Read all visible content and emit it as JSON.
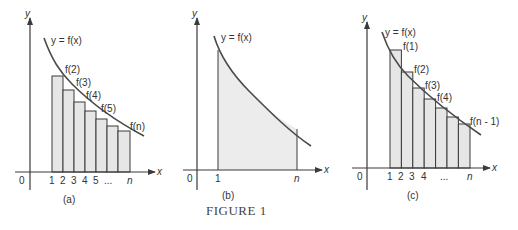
{
  "figure": {
    "caption": "FIGURE 1",
    "panels": [
      {
        "id": "a",
        "label": "(a)",
        "y_axis_label": "y",
        "x_axis_label": "x",
        "origin_label": "0",
        "curve_label": "y = f(x)",
        "x_ticks": [
          "1",
          "2",
          "3",
          "4",
          "5",
          "...",
          "n"
        ],
        "bar_labels": [
          "f(2)",
          "f(3)",
          "f(4)",
          "f(5)",
          "f(n)"
        ],
        "description": "Inscribed rectangles under decreasing curve from x=1 to x=n (right endpoints)"
      },
      {
        "id": "b",
        "label": "(b)",
        "y_axis_label": "y",
        "x_axis_label": "x",
        "origin_label": "0",
        "curve_label": "y = f(x)",
        "x_ticks": [
          "1",
          "n"
        ],
        "description": "Shaded area under curve from x=1 to x=n"
      },
      {
        "id": "c",
        "label": "(c)",
        "y_axis_label": "y",
        "x_axis_label": "x",
        "origin_label": "0",
        "curve_label": "y = f(x)",
        "x_ticks": [
          "1",
          "2",
          "3",
          "4",
          "...",
          "n"
        ],
        "bar_labels": [
          "f(1)",
          "f(2)",
          "f(3)",
          "f(4)",
          "f(n - 1)"
        ],
        "description": "Circumscribed rectangles over decreasing curve from x=1 to x=n (left endpoints)"
      }
    ]
  }
}
